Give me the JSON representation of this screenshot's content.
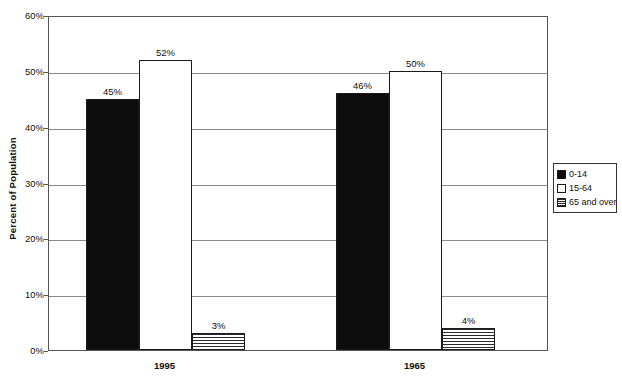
{
  "chart_data": {
    "type": "bar",
    "title": "",
    "xlabel": "",
    "ylabel": "Percent of Population",
    "ylim": [
      0,
      60
    ],
    "ytick_labels": [
      "0%",
      "10%",
      "20%",
      "30%",
      "40%",
      "50%",
      "60%"
    ],
    "ytick_values": [
      0,
      10,
      20,
      30,
      40,
      50,
      60
    ],
    "grid": true,
    "legend_position": "right",
    "categories": [
      "1995",
      "1965"
    ],
    "series": [
      {
        "name": "0-14",
        "fill": "solid",
        "values": [
          45,
          46
        ],
        "value_labels": [
          "45%",
          "46%"
        ]
      },
      {
        "name": "15-64",
        "fill": "empty",
        "values": [
          52,
          50
        ],
        "value_labels": [
          "52%",
          "50%"
        ]
      },
      {
        "name": "65 and over",
        "fill": "hatch",
        "values": [
          3,
          4
        ],
        "value_labels": [
          "3%",
          "4%"
        ]
      }
    ]
  },
  "legend": {
    "items": [
      {
        "label": "0-14",
        "fill": "solid"
      },
      {
        "label": "15-64",
        "fill": "empty"
      },
      {
        "label": "65 and over",
        "fill": "hatch"
      }
    ]
  },
  "colors": {
    "series_solid": "#0d0d0d",
    "series_empty": "#ffffff",
    "series_hatch": "#2b2b2b",
    "axis": "#555555",
    "gridline": "#8a8a8a",
    "text": "#111111",
    "background": "#ffffff"
  }
}
